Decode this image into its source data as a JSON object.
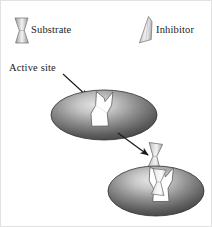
{
  "figure": {
    "background_color": "#ffffff",
    "width": 212,
    "height": 227
  },
  "legend": {
    "items": [
      {
        "key": "substrate",
        "label": "Substrate",
        "icon": "hourglass-shape-icon",
        "shape": "hourglass",
        "fill_light": "#f2f2f2",
        "fill_dark": "#8f8f8f",
        "stroke": "#6b6b6b"
      },
      {
        "key": "inhibitor",
        "label": "Inhibitor",
        "icon": "wedge-shape-icon",
        "shape": "wedge",
        "fill_light": "#f4f4f4",
        "fill_dark": "#9a9a9a",
        "stroke": "#6b6b6b"
      }
    ]
  },
  "annotations": {
    "active_site": {
      "label": "Active site",
      "pointer": "arrow-down-right"
    },
    "process_arrow": {
      "label": "",
      "direction": "down-right"
    }
  },
  "enzymes": [
    {
      "key": "free-enzyme",
      "state": "active-site-open",
      "fill_light": "#d8d8d8",
      "fill_dark": "#4a4a4a",
      "stroke": "#3a3a3a",
      "cleft_fill": "#ffffff"
    },
    {
      "key": "inhibited-enzyme",
      "state": "inhibitor-bound",
      "fill_light": "#d8d8d8",
      "fill_dark": "#4a4a4a",
      "stroke": "#3a3a3a",
      "cleft_fill": "#ffffff"
    }
  ],
  "molecules": [
    {
      "key": "free-inhibitor",
      "shape": "hourglass",
      "fill_light": "#f2f2f2",
      "fill_dark": "#9a9a9a",
      "stroke": "#5f5f5f"
    },
    {
      "key": "bound-inhibitor",
      "shape": "hourglass",
      "fill_light": "#fbfbfb",
      "fill_dark": "#c9c9c9",
      "stroke": "#6b6b6b"
    }
  ],
  "colors": {
    "ink": "#1a1a1a",
    "frame": "#e2e2e2",
    "enzyme_dark": "#4a4a4a",
    "enzyme_light": "#d8d8d8"
  }
}
